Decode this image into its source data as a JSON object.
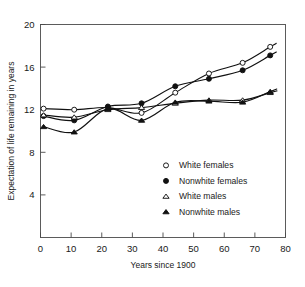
{
  "chart_data": {
    "type": "line",
    "title": "",
    "xlabel": "Years since 1900",
    "ylabel": "Expectation of life remaining in years",
    "xlim": [
      0,
      80
    ],
    "ylim": [
      0,
      20
    ],
    "xticks": [
      0,
      10,
      20,
      30,
      40,
      50,
      60,
      70,
      80
    ],
    "yticks": [
      4,
      8,
      12,
      16,
      20
    ],
    "grid": false,
    "legend_position": "inside-lower-right",
    "x": [
      1,
      11,
      22,
      33,
      44,
      55,
      66,
      75
    ],
    "series": [
      {
        "name": "White females",
        "marker": "open-circle",
        "values": [
          12.1,
          12.0,
          12.2,
          11.7,
          13.6,
          15.4,
          16.4,
          17.9
        ]
      },
      {
        "name": "Nonwhite females",
        "marker": "filled-circle",
        "values": [
          11.4,
          11.0,
          12.3,
          12.6,
          14.2,
          14.9,
          15.7,
          17.1
        ]
      },
      {
        "name": "White males",
        "marker": "open-triangle",
        "values": [
          11.5,
          11.3,
          12.0,
          12.2,
          12.6,
          12.9,
          12.9,
          13.6
        ]
      },
      {
        "name": "Nonwhite males",
        "marker": "filled-triangle",
        "values": [
          10.4,
          9.9,
          12.1,
          11.0,
          12.7,
          12.8,
          12.7,
          13.7
        ]
      }
    ]
  },
  "axes": {
    "x_tick_labels": [
      "0",
      "10",
      "20",
      "30",
      "40",
      "50",
      "60",
      "70",
      "80"
    ],
    "y_tick_labels": [
      "4",
      "8",
      "12",
      "16",
      "20"
    ],
    "x_title": "Years since 1900",
    "y_title": "Expectation of life remaining in years"
  },
  "legend": {
    "items": [
      {
        "label": "White females",
        "marker": "open-circle"
      },
      {
        "label": "Nonwhite females",
        "marker": "filled-circle"
      },
      {
        "label": "White males",
        "marker": "open-triangle"
      },
      {
        "label": "Nonwhite males",
        "marker": "filled-triangle"
      }
    ]
  },
  "colors": {
    "ink": "#111111",
    "frame": "#4a4a4a",
    "background": "#ffffff"
  }
}
